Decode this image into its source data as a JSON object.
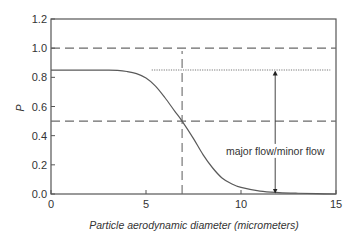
{
  "chart_data": {
    "type": "line",
    "title": "",
    "xlabel": "Particle aerodynamic diameter (micrometers)",
    "xlabel_parts": {
      "prefix": "Particle aerodynamic diameter (",
      "italic_unit": "micrometers",
      "suffix": ")"
    },
    "ylabel": "P",
    "xlim": [
      0,
      15
    ],
    "ylim": [
      0,
      1.2
    ],
    "xticks": [
      0,
      5,
      10,
      15
    ],
    "xtick_labels": [
      "0",
      "5",
      "10",
      "15"
    ],
    "yticks": [
      0.0,
      0.2,
      0.4,
      0.6,
      0.8,
      1.0,
      1.2
    ],
    "ytick_labels": [
      "0.0",
      "0.2",
      "0.4",
      "0.6",
      "0.8",
      "1.0",
      "1.2"
    ],
    "grid": false,
    "legend": null,
    "series": [
      {
        "name": "P",
        "style": "solid",
        "x": [
          0,
          1,
          2,
          3,
          3.5,
          4,
          4.5,
          5,
          5.5,
          6,
          6.5,
          6.9,
          7.5,
          8,
          8.5,
          9,
          9.5,
          10,
          11,
          12,
          13,
          14,
          15
        ],
        "values": [
          0.85,
          0.85,
          0.85,
          0.85,
          0.848,
          0.84,
          0.825,
          0.795,
          0.74,
          0.66,
          0.57,
          0.5,
          0.38,
          0.27,
          0.18,
          0.11,
          0.07,
          0.045,
          0.02,
          0.01,
          0.005,
          0.002,
          0.0
        ]
      }
    ],
    "reference_lines": [
      {
        "orientation": "horizontal",
        "y": 1.0,
        "style": "dashed",
        "x_from": 0,
        "x_to": 15
      },
      {
        "orientation": "horizontal",
        "y": 0.5,
        "style": "dashed",
        "x_from": 0,
        "x_to": 15
      },
      {
        "orientation": "horizontal",
        "y": 0.85,
        "style": "dotted",
        "x_from": 5.3,
        "x_to": 14.7
      },
      {
        "orientation": "vertical",
        "x": 6.9,
        "style": "dashed",
        "y_from": 0,
        "y_to": 0.98
      }
    ],
    "annotations": [
      {
        "type": "double-arrow",
        "x": 11.8,
        "y_from": 0.0,
        "y_to": 0.85,
        "label": "major flow/minor flow"
      }
    ]
  },
  "labels": {
    "annotation": "major flow/minor flow",
    "ylabel": "P"
  }
}
